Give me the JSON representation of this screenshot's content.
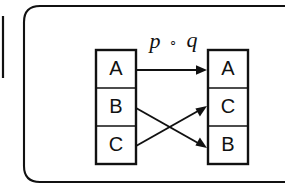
{
  "figure": {
    "kind": "function-composition-diagram",
    "background_color": "#ffffff",
    "ink_color": "#111111",
    "frame": {
      "name": "rounded-page-border",
      "corner_radius": 16
    },
    "map_label": {
      "full": "p ∘ q",
      "left_symbol": "p",
      "operator": "∘",
      "right_symbol": "q"
    },
    "domain_column": {
      "name": "domain-set",
      "cells": [
        {
          "label": "A"
        },
        {
          "label": "B"
        },
        {
          "label": "C"
        }
      ]
    },
    "codomain_column": {
      "name": "codomain-set",
      "cells": [
        {
          "label": "A"
        },
        {
          "label": "C"
        },
        {
          "label": "B"
        }
      ]
    },
    "mappings": [
      {
        "from": "A",
        "to": "A",
        "style": "straight"
      },
      {
        "from": "B",
        "to": "B",
        "style": "crossing"
      },
      {
        "from": "C",
        "to": "C",
        "style": "crossing"
      }
    ]
  }
}
